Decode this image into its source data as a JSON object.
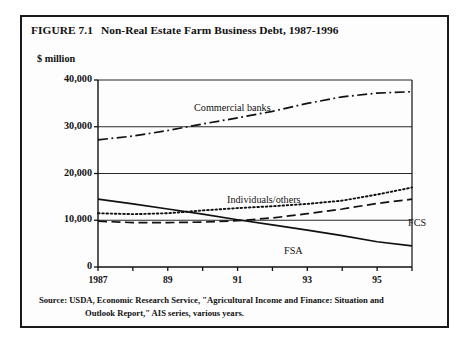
{
  "figure": {
    "number": "FIGURE 7.1",
    "title": "Non-Real Estate Farm Business Debt, 1987-1996",
    "unit_label": "$ million",
    "source_line_1": "Source:  USDA, Economic Research Service, \"Agricultural Income and Finance: Situation and",
    "source_line_2": "Outlook Report,\" AIS series, various years.",
    "border_color": "#1a1a1a",
    "ink_color": "#111111"
  },
  "chart_data": {
    "type": "line",
    "title": "Non-Real Estate Farm Business Debt, 1987-1996",
    "subtitle": "",
    "xlabel": "",
    "ylabel": "$ million",
    "x": [
      1987,
      1988,
      1989,
      1990,
      1991,
      1992,
      1993,
      1994,
      1995,
      1996
    ],
    "xlim": [
      1987,
      1996
    ],
    "ylim": [
      0,
      40000
    ],
    "yticks": [
      0,
      10000,
      20000,
      30000,
      40000
    ],
    "ytick_labels": [
      "0",
      "10,000",
      "20,000",
      "30,000",
      "40,000"
    ],
    "xticks": [
      1987,
      1988,
      1989,
      1990,
      1991,
      1992,
      1993,
      1994,
      1995,
      1996
    ],
    "xtick_labels": [
      "1987",
      "",
      "89",
      "",
      "91",
      "",
      "93",
      "",
      "95",
      ""
    ],
    "grid": true,
    "grid_axis": "y",
    "legend_position": "inline-annotations",
    "series": [
      {
        "name": "Commercial banks",
        "linestyle": "dash-dot",
        "color": "#111111",
        "values": [
          27200,
          28000,
          29200,
          30600,
          31900,
          33300,
          35000,
          36400,
          37200,
          37500
        ],
        "label_position": "upper-center"
      },
      {
        "name": "Individuals/others",
        "linestyle": "dotted",
        "color": "#111111",
        "values": [
          11500,
          11300,
          11500,
          12100,
          12600,
          13000,
          13500,
          14200,
          15500,
          17000
        ],
        "label_position": "middle-center"
      },
      {
        "name": "FCS",
        "linestyle": "long-dash",
        "color": "#111111",
        "values": [
          9800,
          9500,
          9500,
          9600,
          9900,
          10500,
          11400,
          12400,
          13600,
          14500
        ],
        "label_position": "middle-right"
      },
      {
        "name": "FSA",
        "linestyle": "solid",
        "color": "#111111",
        "values": [
          14500,
          13500,
          12400,
          11300,
          10100,
          9000,
          7900,
          6700,
          5400,
          4500
        ],
        "label_position": "lower-center"
      }
    ]
  }
}
